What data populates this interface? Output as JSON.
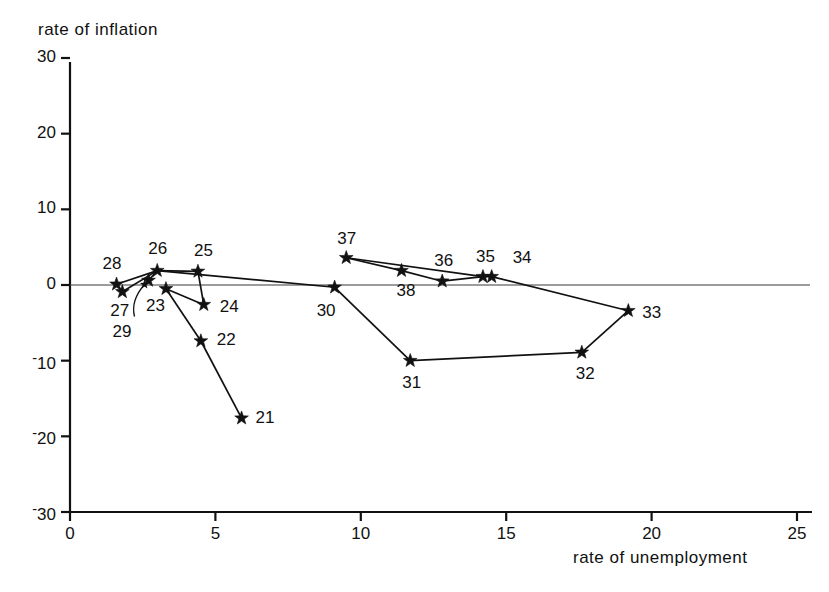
{
  "chart_data": {
    "type": "scatter",
    "title": "",
    "xlabel": "rate of unemployment",
    "ylabel": "rate of inflation",
    "xlim": [
      0,
      25.4
    ],
    "ylim": [
      -30,
      30
    ],
    "xticks": [
      0,
      5,
      10,
      15,
      20,
      25
    ],
    "xtick_labels": [
      "0",
      "5",
      "10",
      "15",
      "20",
      "25"
    ],
    "yticks": [
      30,
      20,
      10,
      0,
      -10,
      -20,
      -30
    ],
    "ytick_labels": [
      "30",
      "20",
      "10",
      "0",
      "-10",
      "-20",
      "-30"
    ],
    "grid": false,
    "legend": "none",
    "marker": "star",
    "zero_line": true,
    "point_label_role": "year (two-digit)",
    "points": [
      {
        "label": "21",
        "x": 5.9,
        "y": -17.6,
        "label_dx": 14,
        "label_dy": -10
      },
      {
        "label": "22",
        "x": 4.5,
        "y": -7.4,
        "label_dx": 16,
        "label_dy": -11
      },
      {
        "label": "23",
        "x": 3.3,
        "y": -0.5,
        "label_dx": -20,
        "label_dy": 7
      },
      {
        "label": "24",
        "x": 4.6,
        "y": -2.6,
        "label_dx": 16,
        "label_dy": -8
      },
      {
        "label": "25",
        "x": 4.4,
        "y": 1.8,
        "label_dx": -4,
        "label_dy": -30
      },
      {
        "label": "26",
        "x": 3.0,
        "y": 1.9,
        "label_dx": -9,
        "label_dy": -32
      },
      {
        "label": "27",
        "x": 1.8,
        "y": -0.9,
        "label_dx": -12,
        "label_dy": 9
      },
      {
        "label": "28",
        "x": 1.6,
        "y": 0.1,
        "label_dx": -14,
        "label_dy": -30
      },
      {
        "label": "29",
        "x": 2.7,
        "y": 0.6,
        "label_dx": -36,
        "label_dy": 42
      },
      {
        "label": "30",
        "x": 9.1,
        "y": -0.3,
        "label_dx": -18,
        "label_dy": 14
      },
      {
        "label": "31",
        "x": 11.7,
        "y": -10.0,
        "label_dx": -8,
        "label_dy": 12
      },
      {
        "label": "32",
        "x": 17.6,
        "y": -8.9,
        "label_dx": -6,
        "label_dy": 12
      },
      {
        "label": "33",
        "x": 19.2,
        "y": -3.4,
        "label_dx": 14,
        "label_dy": -8
      },
      {
        "label": "34",
        "x": 14.5,
        "y": 1.1,
        "label_dx": 21,
        "label_dy": -29
      },
      {
        "label": "35",
        "x": 14.2,
        "y": 1.1,
        "label_dx": -7,
        "label_dy": -30
      },
      {
        "label": "36",
        "x": 12.8,
        "y": 0.5,
        "label_dx": -8,
        "label_dy": -30
      },
      {
        "label": "37",
        "x": 9.5,
        "y": 3.6,
        "label_dx": -9,
        "label_dy": -29
      },
      {
        "label": "38",
        "x": 11.4,
        "y": 1.9,
        "label_dx": -5,
        "label_dy": 10
      }
    ],
    "series_path": [
      "21",
      "22",
      "23",
      "24",
      "25",
      "26",
      "27",
      "28",
      "29",
      "23",
      "26",
      "25",
      "24",
      "30",
      "31",
      "32",
      "33",
      "34",
      "35",
      "36",
      "38",
      "37",
      "26"
    ],
    "connections": [
      [
        "21",
        "22"
      ],
      [
        "22",
        "23"
      ],
      [
        "23",
        "24"
      ],
      [
        "24",
        "25"
      ],
      [
        "25",
        "26"
      ],
      [
        "26",
        "27"
      ],
      [
        "27",
        "28"
      ],
      [
        "28",
        "26"
      ],
      [
        "29",
        "26"
      ],
      [
        "26",
        "30"
      ],
      [
        "30",
        "31"
      ],
      [
        "31",
        "32"
      ],
      [
        "32",
        "33"
      ],
      [
        "33",
        "34"
      ],
      [
        "34",
        "35"
      ],
      [
        "35",
        "36"
      ],
      [
        "36",
        "38"
      ],
      [
        "38",
        "37"
      ],
      [
        "37",
        "35"
      ]
    ]
  }
}
